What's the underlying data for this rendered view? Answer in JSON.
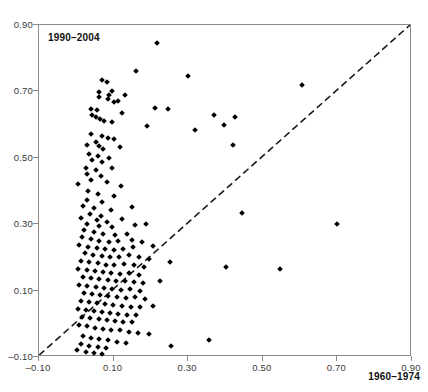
{
  "figure": {
    "background": "#ffffff",
    "top_bleed_text": "",
    "marker_color": "#000000",
    "axis_color": "#8a8a8a",
    "reference_line_color": "#1a1a1a"
  },
  "labels": {
    "top_left": "1990–2004",
    "bottom_right": "1960–1974"
  },
  "chart_data": {
    "type": "scatter",
    "title": "",
    "xlabel": "1960–1974",
    "ylabel": "1990–2004",
    "xlim": [
      -0.1,
      0.9
    ],
    "ylim": [
      -0.1,
      0.9
    ],
    "xticks": [
      -0.1,
      0.1,
      0.3,
      0.5,
      0.7,
      0.9
    ],
    "yticks": [
      -0.1,
      0.1,
      0.3,
      0.5,
      0.7,
      0.9
    ],
    "xticklabels": [
      "-0.10",
      "0.10",
      "0.30",
      "0.50",
      "0.70",
      "0.90"
    ],
    "yticklabels": [
      "-0.10",
      "0.10",
      "0.30",
      "0.50",
      "0.70",
      "0.90"
    ],
    "grid": false,
    "legend": null,
    "marker": "diamond",
    "marker_size": 4,
    "reference_line": {
      "type": "identity",
      "label": "y = x",
      "style": "dashed",
      "from": [
        -0.1,
        -0.1
      ],
      "to": [
        0.9,
        0.9
      ]
    },
    "n_points": 190,
    "points": [
      [
        0.215,
        0.845
      ],
      [
        0.605,
        0.72
      ],
      [
        0.16,
        0.762
      ],
      [
        0.3,
        0.745
      ],
      [
        0.07,
        0.735
      ],
      [
        0.082,
        0.727
      ],
      [
        0.095,
        0.7
      ],
      [
        0.06,
        0.697
      ],
      [
        0.088,
        0.69
      ],
      [
        0.062,
        0.682
      ],
      [
        0.085,
        0.676
      ],
      [
        0.112,
        0.672
      ],
      [
        0.1,
        0.668
      ],
      [
        0.13,
        0.69
      ],
      [
        0.04,
        0.648
      ],
      [
        0.055,
        0.645
      ],
      [
        0.21,
        0.65
      ],
      [
        0.245,
        0.648
      ],
      [
        0.043,
        0.63
      ],
      [
        0.122,
        0.635
      ],
      [
        0.053,
        0.622
      ],
      [
        0.063,
        0.618
      ],
      [
        0.075,
        0.612
      ],
      [
        0.095,
        0.608
      ],
      [
        0.37,
        0.628
      ],
      [
        0.425,
        0.622
      ],
      [
        0.395,
        0.6
      ],
      [
        0.19,
        0.595
      ],
      [
        0.318,
        0.585
      ],
      [
        0.04,
        0.572
      ],
      [
        0.068,
        0.566
      ],
      [
        0.084,
        0.56
      ],
      [
        0.1,
        0.556
      ],
      [
        0.052,
        0.548
      ],
      [
        0.03,
        0.54
      ],
      [
        0.062,
        0.535
      ],
      [
        0.072,
        0.528
      ],
      [
        0.118,
        0.532
      ],
      [
        0.42,
        0.54
      ],
      [
        0.035,
        0.512
      ],
      [
        0.058,
        0.505
      ],
      [
        0.088,
        0.5
      ],
      [
        0.043,
        0.492
      ],
      [
        0.068,
        0.486
      ],
      [
        0.025,
        0.47
      ],
      [
        0.052,
        0.462
      ],
      [
        0.095,
        0.468
      ],
      [
        0.028,
        0.45
      ],
      [
        0.065,
        0.445
      ],
      [
        0.04,
        0.432
      ],
      [
        0.082,
        0.428
      ],
      [
        0.005,
        0.42
      ],
      [
        0.12,
        0.415
      ],
      [
        0.032,
        0.4
      ],
      [
        0.058,
        0.392
      ],
      [
        0.1,
        0.385
      ],
      [
        0.03,
        0.372
      ],
      [
        0.07,
        0.366
      ],
      [
        0.018,
        0.355
      ],
      [
        0.048,
        0.348
      ],
      [
        0.092,
        0.344
      ],
      [
        0.148,
        0.352
      ],
      [
        0.038,
        0.33
      ],
      [
        0.065,
        0.325
      ],
      [
        0.012,
        0.318
      ],
      [
        0.055,
        0.312
      ],
      [
        0.082,
        0.308
      ],
      [
        0.122,
        0.315
      ],
      [
        0.028,
        0.3
      ],
      [
        0.06,
        0.295
      ],
      [
        0.095,
        0.292
      ],
      [
        0.158,
        0.298
      ],
      [
        0.188,
        0.302
      ],
      [
        0.445,
        0.335
      ],
      [
        0.7,
        0.302
      ],
      [
        0.02,
        0.282
      ],
      [
        0.048,
        0.276
      ],
      [
        0.072,
        0.272
      ],
      [
        0.105,
        0.268
      ],
      [
        0.135,
        0.272
      ],
      [
        0.015,
        0.26
      ],
      [
        0.04,
        0.255
      ],
      [
        0.062,
        0.25
      ],
      [
        0.088,
        0.246
      ],
      [
        0.112,
        0.248
      ],
      [
        0.148,
        0.252
      ],
      [
        0.175,
        0.245
      ],
      [
        0.008,
        0.238
      ],
      [
        0.032,
        0.232
      ],
      [
        0.055,
        0.228
      ],
      [
        0.078,
        0.224
      ],
      [
        0.1,
        0.222
      ],
      [
        0.125,
        0.226
      ],
      [
        0.152,
        0.23
      ],
      [
        0.205,
        0.235
      ],
      [
        0.022,
        0.212
      ],
      [
        0.045,
        0.208
      ],
      [
        0.068,
        0.204
      ],
      [
        0.09,
        0.2
      ],
      [
        0.115,
        0.202
      ],
      [
        0.14,
        0.206
      ],
      [
        0.168,
        0.2
      ],
      [
        0.195,
        0.196
      ],
      [
        0.012,
        0.19
      ],
      [
        0.035,
        0.186
      ],
      [
        0.058,
        0.182
      ],
      [
        0.08,
        0.178
      ],
      [
        0.102,
        0.176
      ],
      [
        0.128,
        0.18
      ],
      [
        0.155,
        0.178
      ],
      [
        0.182,
        0.172
      ],
      [
        0.25,
        0.185
      ],
      [
        0.4,
        0.17
      ],
      [
        0.545,
        0.165
      ],
      [
        0.005,
        0.166
      ],
      [
        0.028,
        0.162
      ],
      [
        0.05,
        0.158
      ],
      [
        0.072,
        0.155
      ],
      [
        0.094,
        0.152
      ],
      [
        0.118,
        0.15
      ],
      [
        0.142,
        0.152
      ],
      [
        0.168,
        0.148
      ],
      [
        0.018,
        0.142
      ],
      [
        0.04,
        0.138
      ],
      [
        0.062,
        0.134
      ],
      [
        0.084,
        0.131
      ],
      [
        0.106,
        0.128
      ],
      [
        0.13,
        0.13
      ],
      [
        0.155,
        0.126
      ],
      [
        0.18,
        0.122
      ],
      [
        0.225,
        0.128
      ],
      [
        0.008,
        0.118
      ],
      [
        0.03,
        0.114
      ],
      [
        0.052,
        0.11
      ],
      [
        0.074,
        0.107
      ],
      [
        0.096,
        0.104
      ],
      [
        0.12,
        0.102
      ],
      [
        0.145,
        0.104
      ],
      [
        0.172,
        0.1
      ],
      [
        0.02,
        0.094
      ],
      [
        0.042,
        0.09
      ],
      [
        0.064,
        0.086
      ],
      [
        0.086,
        0.083
      ],
      [
        0.108,
        0.08
      ],
      [
        0.132,
        0.078
      ],
      [
        0.158,
        0.08
      ],
      [
        0.185,
        0.076
      ],
      [
        0.012,
        0.07
      ],
      [
        0.034,
        0.066
      ],
      [
        0.056,
        0.062
      ],
      [
        0.078,
        0.059
      ],
      [
        0.098,
        0.056
      ],
      [
        0.122,
        0.054
      ],
      [
        0.146,
        0.052
      ],
      [
        0.17,
        0.05
      ],
      [
        0.205,
        0.054
      ],
      [
        0.004,
        0.046
      ],
      [
        0.026,
        0.042
      ],
      [
        0.048,
        0.038
      ],
      [
        0.07,
        0.035
      ],
      [
        0.09,
        0.032
      ],
      [
        0.112,
        0.03
      ],
      [
        0.136,
        0.028
      ],
      [
        0.16,
        0.026
      ],
      [
        0.016,
        0.02
      ],
      [
        0.038,
        0.016
      ],
      [
        0.06,
        0.013
      ],
      [
        0.082,
        0.01
      ],
      [
        0.104,
        0.008
      ],
      [
        0.126,
        0.006
      ],
      [
        0.15,
        0.004
      ],
      [
        0.006,
        -0.004
      ],
      [
        0.028,
        -0.008
      ],
      [
        0.05,
        -0.012
      ],
      [
        0.072,
        -0.015
      ],
      [
        0.094,
        -0.018
      ],
      [
        0.118,
        -0.02
      ],
      [
        0.142,
        -0.024
      ],
      [
        0.166,
        -0.028
      ],
      [
        0.195,
        -0.032
      ],
      [
        0.018,
        -0.038
      ],
      [
        0.04,
        -0.042
      ],
      [
        0.062,
        -0.046
      ],
      [
        0.085,
        -0.05
      ],
      [
        0.108,
        -0.054
      ],
      [
        0.132,
        -0.058
      ],
      [
        0.012,
        -0.062
      ],
      [
        0.035,
        -0.066
      ],
      [
        0.058,
        -0.07
      ],
      [
        0.08,
        -0.074
      ],
      [
        0.355,
        -0.05
      ],
      [
        0.255,
        -0.068
      ],
      [
        0.002,
        -0.08
      ],
      [
        0.025,
        -0.084
      ],
      [
        0.048,
        -0.088
      ],
      [
        0.07,
        -0.092
      ]
    ]
  }
}
